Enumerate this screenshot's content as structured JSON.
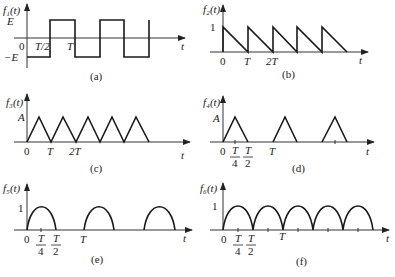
{
  "panels": [
    {
      "id": "a",
      "ylabel": "f₁(t)",
      "caption": "(a)",
      "levels": {
        "top": "E",
        "bottom": "−E",
        "origin": "0"
      },
      "ticks": [
        "T/2",
        "T"
      ],
      "xlabel": "t",
      "type": "square"
    },
    {
      "id": "b",
      "ylabel": "f₂(t)",
      "caption": "(b)",
      "levels": {
        "top": "1",
        "origin": "0"
      },
      "ticks": [
        "T",
        "2T"
      ],
      "xlabel": "t",
      "type": "sawtooth"
    },
    {
      "id": "c",
      "ylabel": "f₃(t)",
      "caption": "(c)",
      "levels": {
        "top": "A",
        "origin": "0"
      },
      "ticks": [
        "T",
        "2T"
      ],
      "xlabel": "t",
      "type": "triangle"
    },
    {
      "id": "d",
      "ylabel": "f₄(t)",
      "caption": "(d)",
      "levels": {
        "top": "A",
        "origin": "0"
      },
      "ticks": [
        "T/4",
        "T/2",
        "T"
      ],
      "xlabel": "t",
      "type": "triangle-pulse"
    },
    {
      "id": "e",
      "ylabel": "f₅(t)",
      "caption": "(e)",
      "levels": {
        "top": "1",
        "origin": "0"
      },
      "ticks": [
        "T/4",
        "T/2",
        "T"
      ],
      "xlabel": "t",
      "type": "half-wave-rectified-sine"
    },
    {
      "id": "f",
      "ylabel": "f₆(t)",
      "caption": "(f)",
      "levels": {
        "top": "1",
        "origin": "0"
      },
      "ticks": [
        "T/4",
        "T/2",
        "T"
      ],
      "xlabel": "t",
      "type": "full-wave-rectified-sine"
    }
  ],
  "fractions": {
    "quarter": {
      "num": "T",
      "den": "4"
    },
    "half": {
      "num": "T",
      "den": "2"
    }
  }
}
